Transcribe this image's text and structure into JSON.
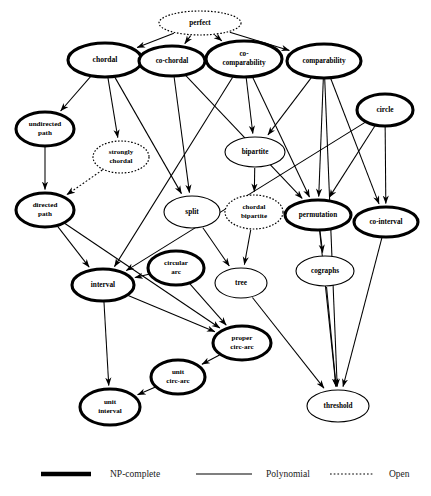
{
  "figure": {
    "type": "diagram",
    "background_color": "#ffffff",
    "line_color": "#000000"
  },
  "nodes": [
    {
      "id": "perfect",
      "label": "perfect",
      "lines": [
        "perfect"
      ],
      "style": "open",
      "cx": 200,
      "cy": 23,
      "rx": 41,
      "ry": 12,
      "fontsize": 7.2
    },
    {
      "id": "chordal",
      "label": "chordal",
      "lines": [
        "chordal"
      ],
      "style": "np",
      "cx": 105,
      "cy": 60,
      "rx": 37,
      "ry": 17,
      "fontsize": 7.6
    },
    {
      "id": "co-chordal",
      "label": "co-chordal",
      "lines": [
        "co-chordal"
      ],
      "style": "np",
      "cx": 172,
      "cy": 61,
      "rx": 33,
      "ry": 15,
      "fontsize": 7.2
    },
    {
      "id": "co-comparability",
      "label": "co-comparability",
      "lines": [
        "co-",
        "comparability"
      ],
      "style": "np",
      "cx": 244,
      "cy": 59,
      "rx": 38,
      "ry": 18,
      "fontsize": 7.2
    },
    {
      "id": "comparability",
      "label": "comparability",
      "lines": [
        "comparability"
      ],
      "style": "np",
      "cx": 324,
      "cy": 61,
      "rx": 37,
      "ry": 17,
      "fontsize": 7.2
    },
    {
      "id": "circle",
      "label": "circle",
      "lines": [
        "circle"
      ],
      "style": "np",
      "cx": 385,
      "cy": 110,
      "rx": 28,
      "ry": 16,
      "fontsize": 7.4
    },
    {
      "id": "undirected-path",
      "label": "undirected path",
      "lines": [
        "undirected",
        "path"
      ],
      "style": "np",
      "cx": 45,
      "cy": 129,
      "rx": 29,
      "ry": 17,
      "fontsize": 7.1
    },
    {
      "id": "strongly-chordal",
      "label": "strongly chordal",
      "lines": [
        "strongly",
        "chordal"
      ],
      "style": "open",
      "cx": 121,
      "cy": 157,
      "rx": 28,
      "ry": 16,
      "fontsize": 7.0
    },
    {
      "id": "bipartite",
      "label": "bipartite",
      "lines": [
        "bipartite"
      ],
      "style": "poly",
      "cx": 255,
      "cy": 152,
      "rx": 30,
      "ry": 15,
      "fontsize": 7.2
    },
    {
      "id": "directed-path",
      "label": "directed path",
      "lines": [
        "directed",
        "path"
      ],
      "style": "np",
      "cx": 45,
      "cy": 210,
      "rx": 29,
      "ry": 17,
      "fontsize": 7.1
    },
    {
      "id": "split",
      "label": "split",
      "lines": [
        "split"
      ],
      "style": "poly",
      "cx": 192,
      "cy": 212,
      "rx": 28,
      "ry": 16,
      "fontsize": 7.3
    },
    {
      "id": "chordal-bipartite",
      "label": "chordal bipartite",
      "lines": [
        "chordal",
        "bipartite"
      ],
      "style": "open",
      "cx": 254,
      "cy": 212,
      "rx": 29,
      "ry": 17,
      "fontsize": 7.0
    },
    {
      "id": "permutation",
      "label": "permutation",
      "lines": [
        "permutation"
      ],
      "style": "np",
      "cx": 318,
      "cy": 215,
      "rx": 33,
      "ry": 15,
      "fontsize": 7.2
    },
    {
      "id": "co-interval",
      "label": "co-interval",
      "lines": [
        "co-interval"
      ],
      "style": "np",
      "cx": 386,
      "cy": 222,
      "rx": 32,
      "ry": 15,
      "fontsize": 7.2
    },
    {
      "id": "circular-arc",
      "label": "circular arc",
      "lines": [
        "circular",
        "arc"
      ],
      "style": "np",
      "cx": 176,
      "cy": 268,
      "rx": 28,
      "ry": 17,
      "fontsize": 7.1
    },
    {
      "id": "interval",
      "label": "interval",
      "lines": [
        "interval"
      ],
      "style": "np",
      "cx": 103,
      "cy": 285,
      "rx": 31,
      "ry": 16,
      "fontsize": 7.3
    },
    {
      "id": "tree",
      "label": "tree",
      "lines": [
        "tree"
      ],
      "style": "poly",
      "cx": 241,
      "cy": 283,
      "rx": 26,
      "ry": 15,
      "fontsize": 7.3
    },
    {
      "id": "cographs",
      "label": "cographs",
      "lines": [
        "cographs"
      ],
      "style": "poly",
      "cx": 325,
      "cy": 271,
      "rx": 29,
      "ry": 15,
      "fontsize": 7.2
    },
    {
      "id": "proper-circ-arc",
      "label": "proper circ-arc",
      "lines": [
        "proper",
        "circ-arc"
      ],
      "style": "np",
      "cx": 242,
      "cy": 343,
      "rx": 29,
      "ry": 17,
      "fontsize": 7.1
    },
    {
      "id": "unit-circ-arc",
      "label": "unit circ-arc",
      "lines": [
        "unit",
        "circ-arc"
      ],
      "style": "np",
      "cx": 178,
      "cy": 377,
      "rx": 27,
      "ry": 17,
      "fontsize": 7.1
    },
    {
      "id": "unit-interval",
      "label": "unit interval",
      "lines": [
        "unit",
        "interval"
      ],
      "style": "np",
      "cx": 110,
      "cy": 407,
      "rx": 30,
      "ry": 18,
      "fontsize": 7.1
    },
    {
      "id": "threshold",
      "label": "threshold",
      "lines": [
        "threshold"
      ],
      "style": "poly",
      "cx": 338,
      "cy": 406,
      "rx": 31,
      "ry": 16,
      "fontsize": 7.2
    }
  ],
  "edges": [
    {
      "from": "perfect",
      "to": "chordal",
      "style": "poly"
    },
    {
      "from": "perfect",
      "to": "co-chordal",
      "style": "poly"
    },
    {
      "from": "perfect",
      "to": "co-comparability",
      "style": "poly"
    },
    {
      "from": "perfect",
      "to": "comparability",
      "style": "poly"
    },
    {
      "from": "chordal",
      "to": "undirected-path",
      "style": "poly"
    },
    {
      "from": "chordal",
      "to": "strongly-chordal",
      "style": "poly"
    },
    {
      "from": "chordal",
      "to": "split",
      "style": "poly"
    },
    {
      "from": "co-chordal",
      "to": "split",
      "style": "poly"
    },
    {
      "from": "co-chordal",
      "to": "permutation",
      "style": "poly"
    },
    {
      "from": "co-comparability",
      "to": "interval",
      "style": "poly"
    },
    {
      "from": "co-comparability",
      "to": "permutation",
      "style": "poly"
    },
    {
      "from": "co-comparability",
      "to": "bipartite",
      "style": "poly"
    },
    {
      "from": "comparability",
      "to": "bipartite",
      "style": "poly"
    },
    {
      "from": "comparability",
      "to": "permutation",
      "style": "poly"
    },
    {
      "from": "comparability",
      "to": "co-interval",
      "style": "poly"
    },
    {
      "from": "comparability",
      "to": "threshold",
      "style": "poly"
    },
    {
      "from": "circle",
      "to": "permutation",
      "style": "poly"
    },
    {
      "from": "circle",
      "to": "co-interval",
      "style": "poly"
    },
    {
      "from": "circle",
      "to": "interval",
      "style": "poly"
    },
    {
      "from": "undirected-path",
      "to": "directed-path",
      "style": "poly"
    },
    {
      "from": "strongly-chordal",
      "to": "directed-path",
      "style": "open"
    },
    {
      "from": "bipartite",
      "to": "chordal-bipartite",
      "style": "poly"
    },
    {
      "from": "directed-path",
      "to": "interval",
      "style": "poly"
    },
    {
      "from": "directed-path",
      "to": "proper-circ-arc",
      "style": "poly"
    },
    {
      "from": "split",
      "to": "tree",
      "style": "poly"
    },
    {
      "from": "chordal-bipartite",
      "to": "tree",
      "style": "poly"
    },
    {
      "from": "permutation",
      "to": "cographs",
      "style": "poly"
    },
    {
      "from": "permutation",
      "to": "threshold",
      "style": "poly"
    },
    {
      "from": "co-interval",
      "to": "threshold",
      "style": "poly"
    },
    {
      "from": "cographs",
      "to": "threshold",
      "style": "poly"
    },
    {
      "from": "circular-arc",
      "to": "interval",
      "style": "poly"
    },
    {
      "from": "circular-arc",
      "to": "proper-circ-arc",
      "style": "poly"
    },
    {
      "from": "interval",
      "to": "unit-interval",
      "style": "poly"
    },
    {
      "from": "interval",
      "to": "proper-circ-arc",
      "style": "poly"
    },
    {
      "from": "tree",
      "to": "threshold",
      "style": "poly"
    },
    {
      "from": "proper-circ-arc",
      "to": "unit-circ-arc",
      "style": "poly"
    },
    {
      "from": "unit-circ-arc",
      "to": "unit-interval",
      "style": "poly"
    }
  ],
  "legend": {
    "items": [
      {
        "id": "np-complete",
        "label": "NP-complete",
        "style": "np"
      },
      {
        "id": "polynomial",
        "label": "Polynomial",
        "style": "poly"
      },
      {
        "id": "open",
        "label": "Open",
        "style": "open"
      }
    ]
  }
}
